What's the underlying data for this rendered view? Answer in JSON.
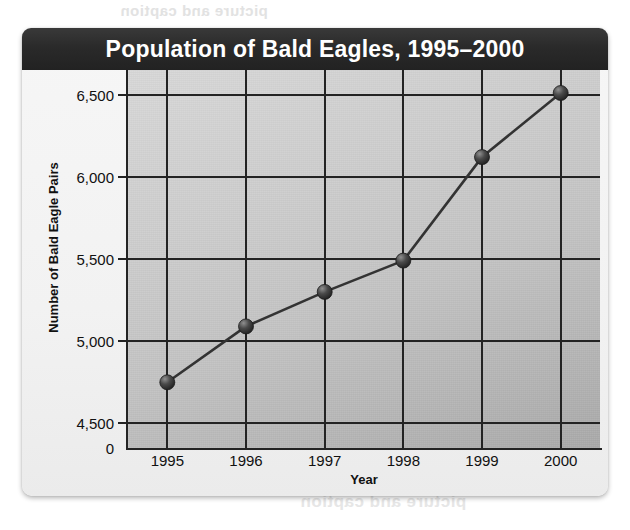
{
  "page": {
    "bleed_text_top": "picture and caption",
    "bleed_text_bottom": "picture and caption"
  },
  "chart_data": {
    "type": "line",
    "title": "Population of Bald Eagles, 1995–2000",
    "xlabel": "Year",
    "ylabel": "Number of Bald Eagle Pairs",
    "categories": [
      "1995",
      "1996",
      "1997",
      "1998",
      "1999",
      "2000"
    ],
    "values": [
      4750,
      5090,
      5300,
      5490,
      6120,
      6510
    ],
    "series": [
      {
        "name": "Number of Bald Eagle Pairs",
        "values": [
          4750,
          5090,
          5300,
          5490,
          6120,
          6510
        ]
      }
    ],
    "ytick_labels": [
      "6,500",
      "6,000",
      "5,500",
      "5,000",
      "4,500",
      "0"
    ],
    "ytick_values": [
      6500,
      6000,
      5500,
      5000,
      4500,
      0
    ],
    "ylim": [
      4350,
      6650
    ],
    "ybaseline_label": "0",
    "grid": true,
    "legend": "none",
    "marker": "filled-circle",
    "line_color": "#333333",
    "marker_color": "#3a3a3a",
    "plot_bg_color": "#c4c4c4",
    "title_bar_color": "#2b2b2b",
    "title_text_color": "#ffffff",
    "axis_color": "#232323"
  }
}
